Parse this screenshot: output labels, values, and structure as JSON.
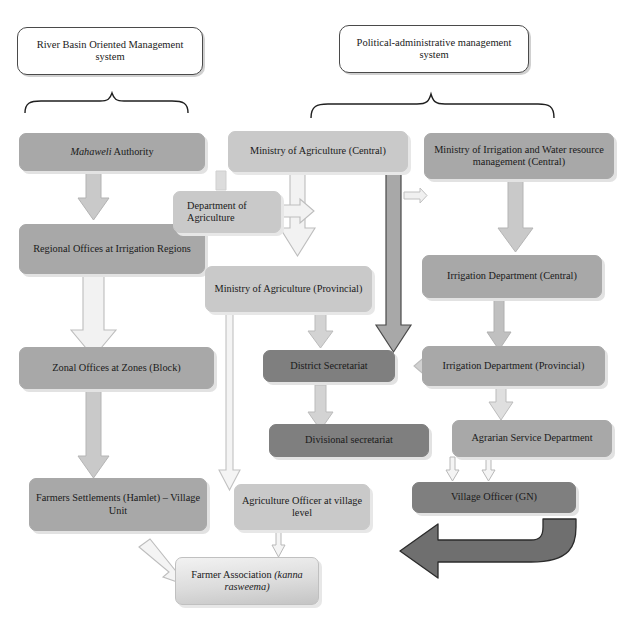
{
  "diagram": {
    "type": "organizational-flowchart",
    "colors": {
      "grey_fill": "#a8a8a8",
      "light_fill": "#c9c9c9",
      "dark_fill": "#7f7f7f",
      "outline": "#4a4a4a",
      "arrow_light": "#c9c9c9",
      "arrow_dark": "#808080",
      "shadow": "#e2e2e2",
      "page_background": "#ffffff"
    },
    "headers": [
      {
        "id": "hdr_river_basin",
        "label": "River Basin Oriented Management system"
      },
      {
        "id": "hdr_political",
        "label": "Political-administrative management system"
      }
    ],
    "nodes": [
      {
        "id": "mahaweli",
        "label_italic": "Mahaweli",
        "label_rest": " Authority",
        "style": "grey"
      },
      {
        "id": "regional_offices",
        "label": "Regional Offices at Irrigation Regions",
        "style": "grey"
      },
      {
        "id": "zonal_offices",
        "label": "Zonal Offices at Zones (Block)",
        "style": "grey"
      },
      {
        "id": "farmers_settlements",
        "label": "Farmers Settlements (Hamlet) – Village Unit",
        "style": "grey"
      },
      {
        "id": "moa_central",
        "label": "Ministry of Agriculture (Central)",
        "style": "light"
      },
      {
        "id": "dept_agriculture",
        "label": "Department of Agriculture",
        "style": "light"
      },
      {
        "id": "moa_provincial",
        "label": "Ministry of Agriculture (Provincial)",
        "style": "light"
      },
      {
        "id": "agri_officer",
        "label": "Agriculture Officer at village level",
        "style": "light"
      },
      {
        "id": "moi_central",
        "label": "Ministry of Irrigation and Water resource management (Central)",
        "style": "grey"
      },
      {
        "id": "irrigation_central",
        "label": "Irrigation Department (Central)",
        "style": "grey"
      },
      {
        "id": "irrigation_prov",
        "label": "Irrigation Department (Provincial)",
        "style": "grey"
      },
      {
        "id": "agrarian_service",
        "label": "Agrarian Service Department",
        "style": "grey"
      },
      {
        "id": "village_officer",
        "label": "Village Officer (GN)",
        "style": "dark"
      },
      {
        "id": "district_sec",
        "label": "District Secretariat",
        "style": "dark"
      },
      {
        "id": "divisional_sec",
        "label": "Divisional secretariat",
        "style": "dark"
      },
      {
        "id": "farmer_association",
        "label_rest": "Farmer Association ",
        "label_italic": "(kanna rasweema)",
        "style": "gradient"
      }
    ],
    "edges": [
      {
        "from": "hdr_river_basin",
        "to": "mahaweli",
        "kind": "brace"
      },
      {
        "from": "hdr_political",
        "to": "moa_central, moi_central",
        "kind": "brace"
      },
      {
        "from": "mahaweli",
        "to": "regional_offices",
        "kind": "block-arrow-down"
      },
      {
        "from": "regional_offices",
        "to": "zonal_offices",
        "kind": "block-arrow-down"
      },
      {
        "from": "zonal_offices",
        "to": "farmers_settlements",
        "kind": "block-arrow-down"
      },
      {
        "from": "farmers_settlements",
        "to": "farmer_association",
        "kind": "thin-arrow-diagonal"
      },
      {
        "from": "moa_central",
        "to": "dept_agriculture",
        "kind": "block-arrow-down"
      },
      {
        "from": "moa_central",
        "to": "moa_provincial",
        "kind": "block-arrow-down"
      },
      {
        "from": "moa_central",
        "to": "district_sec",
        "kind": "long-arrow-down"
      },
      {
        "from": "dept_agriculture",
        "to": "moa_provincial",
        "kind": "thin-arrow-down"
      },
      {
        "from": "dept_agriculture",
        "to": "moa_provincial",
        "kind": "block-arrow-right"
      },
      {
        "from": "moa_provincial",
        "to": "district_sec",
        "kind": "block-arrow-down"
      },
      {
        "from": "moa_provincial",
        "to": "agri_officer",
        "kind": "long-arrow-down"
      },
      {
        "from": "district_sec",
        "to": "divisional_sec",
        "kind": "block-arrow-down"
      },
      {
        "from": "divisional_sec",
        "to": "village_officer",
        "kind": "thin-arrow-down"
      },
      {
        "from": "agri_officer",
        "to": "farmer_association",
        "kind": "thin-arrow-down"
      },
      {
        "from": "moi_central",
        "to": "irrigation_central",
        "kind": "block-arrow-down"
      },
      {
        "from": "irrigation_central",
        "to": "irrigation_prov",
        "kind": "block-arrow-down"
      },
      {
        "from": "irrigation_prov",
        "to": "agrarian_service",
        "kind": "block-arrow-down"
      },
      {
        "from": "irrigation_prov",
        "to": "district_sec",
        "kind": "block-arrow-left"
      },
      {
        "from": "agrarian_service",
        "to": "village_officer",
        "kind": "thin-arrow-down"
      },
      {
        "from": "village_officer",
        "to": "farmer_association",
        "kind": "curved-block-arrow-left"
      }
    ]
  }
}
